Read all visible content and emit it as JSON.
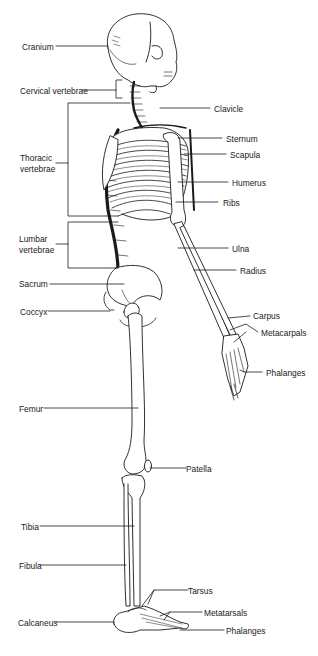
{
  "diagram": {
    "left_labels": [
      {
        "id": "cranium",
        "text": "Cranium"
      },
      {
        "id": "cervical",
        "text": "Cervical vertebrae"
      },
      {
        "id": "thoracic1",
        "text": "Thoracic"
      },
      {
        "id": "thoracic2",
        "text": "vertebrae"
      },
      {
        "id": "lumbar1",
        "text": "Lumbar"
      },
      {
        "id": "lumbar2",
        "text": "vertebrae"
      },
      {
        "id": "sacrum",
        "text": "Sacrum"
      },
      {
        "id": "coccyx",
        "text": "Coccyx"
      },
      {
        "id": "femur",
        "text": "Femur"
      },
      {
        "id": "tibia",
        "text": "Tibia"
      },
      {
        "id": "fibula",
        "text": "Fibula"
      },
      {
        "id": "calcaneus",
        "text": "Calcaneus"
      }
    ],
    "right_labels": [
      {
        "id": "clavicle",
        "text": "Clavicle"
      },
      {
        "id": "sternum",
        "text": "Sternum"
      },
      {
        "id": "scapula",
        "text": "Scapula"
      },
      {
        "id": "humerus",
        "text": "Humerus"
      },
      {
        "id": "ribs",
        "text": "Ribs"
      },
      {
        "id": "ulna",
        "text": "Ulna"
      },
      {
        "id": "radius",
        "text": "Radius"
      },
      {
        "id": "carpus",
        "text": "Carpus"
      },
      {
        "id": "metacarpals",
        "text": "Metacarpals"
      },
      {
        "id": "phalanges_hand",
        "text": "Phalanges"
      },
      {
        "id": "patella",
        "text": "Patella"
      },
      {
        "id": "tarsus",
        "text": "Tarsus"
      },
      {
        "id": "metatarsals",
        "text": "Metatarsals"
      },
      {
        "id": "phalanges_foot",
        "text": "Phalanges"
      }
    ],
    "colors": {
      "line": "#1a1a1a",
      "bone_fill": "#ffffff",
      "background": "#ffffff"
    }
  }
}
